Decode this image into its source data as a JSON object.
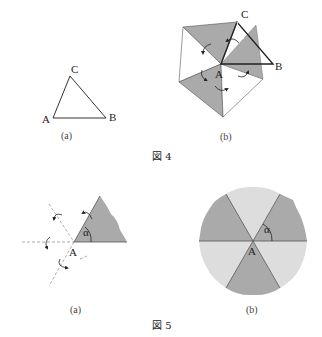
{
  "figure4": {
    "caption": "図 4",
    "panel_a": {
      "label": "(a)",
      "vertices": {
        "A": "A",
        "B": "B",
        "C": "C"
      }
    },
    "panel_b": {
      "label": "(b)",
      "vertices": {
        "A": "A",
        "B": "B",
        "C": "C"
      }
    }
  },
  "figure5": {
    "caption": "図 5",
    "panel_a": {
      "label": "(a)",
      "point": "A",
      "angle": "α"
    },
    "panel_b": {
      "label": "(b)",
      "point": "A",
      "angle": "α"
    }
  },
  "colors": {
    "dark_gray": "#aaaaaa",
    "light_gray": "#dddddd",
    "line": "#333333"
  }
}
